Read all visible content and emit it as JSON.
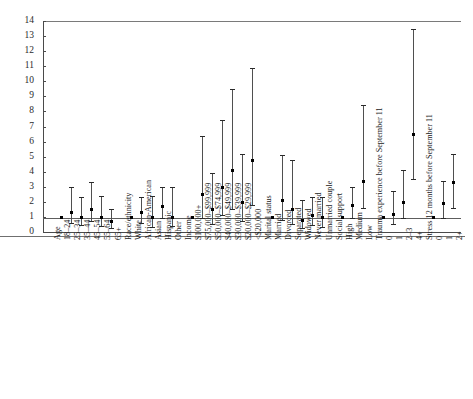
{
  "chart_data": {
    "type": "scatter",
    "plot_style": "forest-plot",
    "title": "",
    "subtitle": "",
    "xlabel": "",
    "ylabel": "",
    "ylim": [
      0,
      14
    ],
    "ytick_labels": [
      "0",
      "1",
      "2",
      "3",
      "4",
      "5",
      "6",
      "7",
      "8",
      "9",
      "10",
      "11",
      "12",
      "13",
      "14"
    ],
    "ytick_values": [
      0,
      1,
      2,
      3,
      4,
      5,
      6,
      7,
      8,
      9,
      10,
      11,
      12,
      13,
      14
    ],
    "grid": false,
    "reference_line": 1,
    "legend": [],
    "categories": [
      "Age",
      "18–24",
      "25–34",
      "35–44",
      "45–54",
      "55–64",
      "65+",
      "Race/ethnicity",
      "White",
      "African-American",
      "Asian",
      "Hispanic",
      "Other",
      "Income",
      "$100,000+",
      "$75,000–$99,999",
      "$50,000–$74,999",
      "$40,000–$49,999",
      "$30,000–$39,999",
      "$20,000–$29,999",
      "<$20,000",
      "Marital status",
      "Married",
      "Divorced",
      "Separated",
      "Widowed",
      "Never married",
      "Unmarried couple",
      "Social support",
      "High",
      "Medium",
      "Low",
      "Trauma experience before September 11",
      "0",
      "1",
      "2–3",
      "4+",
      "Stress 12 months before September 11",
      "0",
      "1",
      "2+"
    ],
    "group_headers": [
      "Age",
      "Race/ethnicity",
      "Income",
      "Marital status",
      "Social support",
      "Trauma experience before September 11",
      "Stress 12 months before September 11"
    ],
    "points": [
      {
        "label": "Age",
        "estimate": null,
        "low": null,
        "high": null,
        "is_header": true
      },
      {
        "label": "18–24",
        "estimate": 1.0,
        "low": 1.0,
        "high": 1.0,
        "reference": true
      },
      {
        "label": "25–34",
        "estimate": 1.35,
        "low": 0.6,
        "high": 3.0
      },
      {
        "label": "35–44",
        "estimate": 1.0,
        "low": 0.45,
        "high": 2.3
      },
      {
        "label": "45–54",
        "estimate": 1.5,
        "low": 0.75,
        "high": 3.3
      },
      {
        "label": "55–64",
        "estimate": 1.0,
        "low": 0.4,
        "high": 2.4
      },
      {
        "label": "65+",
        "estimate": 0.7,
        "low": 0.25,
        "high": 1.5
      },
      {
        "label": "Race/ethnicity",
        "estimate": null,
        "low": null,
        "high": null,
        "is_header": true
      },
      {
        "label": "White",
        "estimate": 1.0,
        "low": 1.0,
        "high": 1.0,
        "reference": true
      },
      {
        "label": "African-American",
        "estimate": 1.3,
        "low": 0.6,
        "high": 2.3
      },
      {
        "label": "Asian",
        "estimate": 1.0,
        "low": 0.35,
        "high": 2.4
      },
      {
        "label": "Hispanic",
        "estimate": 1.75,
        "low": 0.9,
        "high": 3.0
      },
      {
        "label": "Other",
        "estimate": 1.0,
        "low": 0.4,
        "high": 3.0
      },
      {
        "label": "Income",
        "estimate": null,
        "low": null,
        "high": null,
        "is_header": true
      },
      {
        "label": "$100,000+",
        "estimate": 1.0,
        "low": 1.0,
        "high": 1.0,
        "reference": true
      },
      {
        "label": "$75,000–$99,999",
        "estimate": 2.5,
        "low": 0.9,
        "high": 6.4
      },
      {
        "label": "$50,000–$74,999",
        "estimate": 1.5,
        "low": 0.55,
        "high": 3.9
      },
      {
        "label": "$40,000–$49,999",
        "estimate": 3.0,
        "low": 1.1,
        "high": 7.4
      },
      {
        "label": "$30,000–$39,999",
        "estimate": 4.1,
        "low": 1.5,
        "high": 9.5
      },
      {
        "label": "$20,000–$29,999",
        "estimate": 2.0,
        "low": 0.7,
        "high": 5.2
      },
      {
        "label": "<$20,000",
        "estimate": 4.8,
        "low": 1.8,
        "high": 10.9
      },
      {
        "label": "Marital status",
        "estimate": null,
        "low": null,
        "high": null,
        "is_header": true
      },
      {
        "label": "Married",
        "estimate": 1.0,
        "low": 1.0,
        "high": 1.0,
        "reference": true
      },
      {
        "label": "Divorced",
        "estimate": 2.1,
        "low": 0.8,
        "high": 5.1
      },
      {
        "label": "Separated",
        "estimate": 1.5,
        "low": 0.5,
        "high": 4.8
      },
      {
        "label": "Widowed",
        "estimate": 0.8,
        "low": 0.25,
        "high": 2.1
      },
      {
        "label": "Never married",
        "estimate": 1.1,
        "low": 0.45,
        "high": 2.3
      },
      {
        "label": "Unmarried couple",
        "estimate": 1.0,
        "low": 0.3,
        "high": 2.3
      },
      {
        "label": "Social support",
        "estimate": null,
        "low": null,
        "high": null,
        "is_header": true
      },
      {
        "label": "High",
        "estimate": 1.0,
        "low": 1.0,
        "high": 1.0,
        "reference": true
      },
      {
        "label": "Medium",
        "estimate": 1.8,
        "low": 0.9,
        "high": 3.0
      },
      {
        "label": "Low",
        "estimate": 3.4,
        "low": 1.6,
        "high": 8.4
      },
      {
        "label": "Trauma experience before September 11",
        "estimate": null,
        "low": null,
        "high": null,
        "is_header": true
      },
      {
        "label": "0",
        "estimate": 1.0,
        "low": 1.0,
        "high": 1.0,
        "reference": true
      },
      {
        "label": "1",
        "estimate": 1.2,
        "low": 0.55,
        "high": 2.7
      },
      {
        "label": "2–3",
        "estimate": 2.0,
        "low": 0.9,
        "high": 4.1
      },
      {
        "label": "4+",
        "estimate": 6.5,
        "low": 3.5,
        "high": 13.5
      },
      {
        "label": "Stress 12 months before September 11",
        "estimate": null,
        "low": null,
        "high": null,
        "is_header": true
      },
      {
        "label": "0",
        "estimate": 1.0,
        "low": 1.0,
        "high": 1.0,
        "reference": true
      },
      {
        "label": "1",
        "estimate": 1.9,
        "low": 0.9,
        "high": 3.4
      },
      {
        "label": "2+",
        "estimate": 3.3,
        "low": 1.6,
        "high": 5.2
      }
    ]
  },
  "colors": {
    "point": "#000000",
    "interval": "#4f4f4f",
    "axis": "#4a4a4a",
    "text": "#1a1a1a",
    "background": "#ffffff"
  }
}
